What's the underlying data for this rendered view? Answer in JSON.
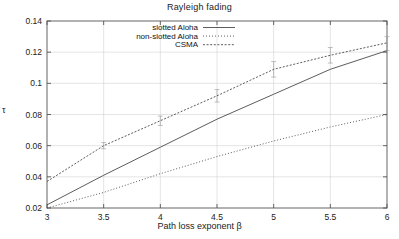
{
  "chart_data": {
    "type": "line",
    "title": "Rayleigh fading",
    "xlabel": "Path loss exponent β",
    "ylabel": "τ",
    "xlim": [
      3,
      6
    ],
    "ylim": [
      0.02,
      0.14
    ],
    "grid": true,
    "legend_position": "top-left-inside",
    "x": [
      3,
      3.5,
      4,
      4.5,
      5,
      5.5,
      6
    ],
    "xticks": [
      "3",
      "3.5",
      "4",
      "4.5",
      "5",
      "5.5",
      "6"
    ],
    "yticks": [
      "0.02",
      "0.04",
      "0.06",
      "0.08",
      "0.1",
      "0.12",
      "0.14"
    ],
    "ytick_values": [
      0.02,
      0.04,
      0.06,
      0.08,
      0.1,
      0.12,
      0.14
    ],
    "series": [
      {
        "name": "slotted Aloha",
        "style": "solid",
        "values": [
          0.022,
          0.041,
          0.059,
          0.077,
          0.093,
          0.109,
          0.121
        ]
      },
      {
        "name": "non-slotted Aloha",
        "style": "dotted",
        "values": [
          0.02,
          0.03,
          0.042,
          0.053,
          0.063,
          0.072,
          0.08
        ]
      },
      {
        "name": "CSMA",
        "style": "dash-dot",
        "errorbars": true,
        "values": [
          0.037,
          0.06,
          0.076,
          0.092,
          0.109,
          0.118,
          0.126
        ],
        "err_low": [
          0.037,
          0.058,
          0.073,
          0.088,
          0.104,
          0.113,
          0.121
        ],
        "err_high": [
          0.037,
          0.062,
          0.079,
          0.096,
          0.114,
          0.123,
          0.13
        ]
      }
    ]
  },
  "legend": {
    "items": [
      {
        "label": "slotted Aloha"
      },
      {
        "label": "non-slotted Aloha"
      },
      {
        "label": "CSMA"
      }
    ]
  }
}
